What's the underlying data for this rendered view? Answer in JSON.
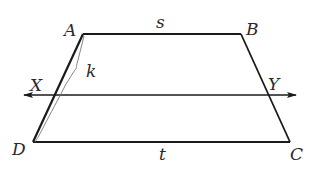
{
  "diagram": {
    "type": "trapezoid with transversal",
    "vertices": {
      "A": {
        "label": "A",
        "x": 83,
        "y": 34
      },
      "B": {
        "label": "B",
        "x": 241,
        "y": 34
      },
      "C": {
        "label": "C",
        "x": 290,
        "y": 142
      },
      "D": {
        "label": "D",
        "x": 33,
        "y": 142
      }
    },
    "points": {
      "X": {
        "label": "X"
      },
      "Y": {
        "label": "Y"
      }
    },
    "segment_labels": {
      "top": "s",
      "bottom": "t",
      "brace": "k"
    },
    "transversal": {
      "y": 95,
      "x_start": 24,
      "x_end": 296,
      "arrows": "both"
    },
    "colors": {
      "line": "#1a1a1a",
      "brace": "#777777",
      "text": "#2a2a2a",
      "background": "#ffffff"
    }
  }
}
